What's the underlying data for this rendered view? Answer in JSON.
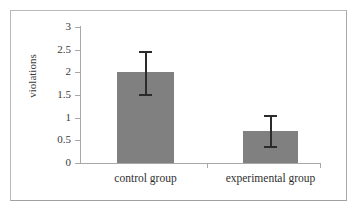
{
  "chart_data": {
    "type": "bar",
    "title": "",
    "subtitle": "",
    "xlabel": "",
    "ylabel": "violations",
    "categories": [
      "control group",
      "experimental group"
    ],
    "values": [
      2.0,
      0.7
    ],
    "errors_upper": [
      0.48,
      0.35
    ],
    "errors_lower": [
      0.48,
      0.33
    ],
    "error_bar_tops": [
      2.48,
      1.05
    ],
    "error_bar_bottoms": [
      1.52,
      0.37
    ],
    "ylim": [
      0,
      3
    ],
    "ytick_labels": [
      "0",
      "0.5",
      "1",
      "1.5",
      "2",
      "2.5",
      "3"
    ],
    "ytick_values": [
      0,
      0.5,
      1,
      1.5,
      2,
      2.5,
      3
    ],
    "grid": false,
    "legend": false,
    "legend_position": "none",
    "bar_color": "#808080",
    "error_bar_color": "#2b2b2b",
    "axis_color": "#a8a8a8",
    "text_color": "#3a3a3a",
    "frame_color": "#b9b9b9",
    "background": "#ffffff"
  },
  "axis": {
    "y_title": "violations"
  }
}
